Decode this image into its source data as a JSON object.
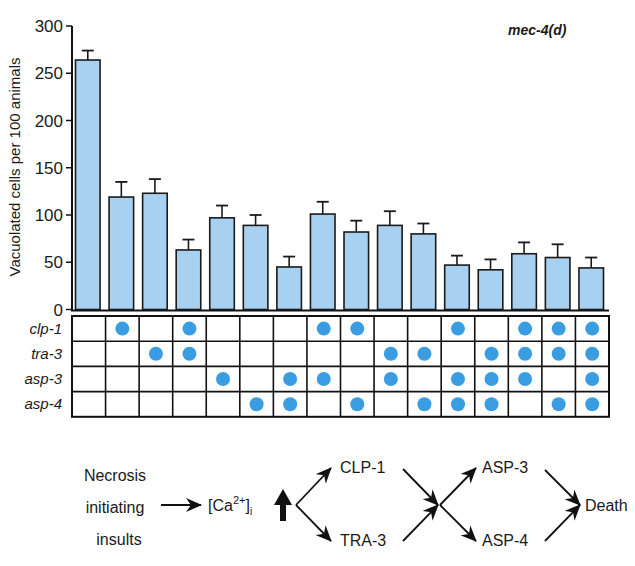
{
  "chart_data": {
    "type": "bar",
    "title": "",
    "strain_label": "mec-4(d)",
    "xlabel": "",
    "ylabel": "Vacuolated cells per 100 animals",
    "ylim": [
      0,
      300
    ],
    "yticks": [
      0,
      50,
      100,
      150,
      200,
      250,
      300
    ],
    "grid": false,
    "legend": null,
    "categories": [
      "1",
      "2",
      "3",
      "4",
      "5",
      "6",
      "7",
      "8",
      "9",
      "10",
      "11",
      "12",
      "13",
      "14",
      "15",
      "16"
    ],
    "series": [
      {
        "name": "Vacuolated cells per 100 animals",
        "values": [
          264,
          119,
          123,
          63,
          97,
          89,
          45,
          101,
          82,
          89,
          80,
          47,
          42,
          59,
          55,
          44
        ],
        "error_upper": [
          274,
          135,
          138,
          74,
          110,
          100,
          56,
          114,
          94,
          104,
          91,
          57,
          53,
          71,
          69,
          55
        ],
        "color": "#a8d0f0"
      }
    ],
    "genotype_table": {
      "rows": [
        "clp-1",
        "tra-3",
        "asp-3",
        "asp-4"
      ],
      "dot_color": "#3b9de1",
      "matrix": [
        [
          0,
          1,
          0,
          1,
          0,
          0,
          0,
          1,
          1,
          0,
          0,
          1,
          0,
          1,
          1,
          1
        ],
        [
          0,
          0,
          1,
          1,
          0,
          0,
          0,
          0,
          0,
          1,
          1,
          0,
          1,
          1,
          1,
          1
        ],
        [
          0,
          0,
          0,
          0,
          1,
          0,
          1,
          1,
          0,
          1,
          0,
          1,
          1,
          1,
          0,
          1
        ],
        [
          0,
          0,
          0,
          0,
          0,
          1,
          1,
          0,
          1,
          0,
          1,
          1,
          1,
          0,
          1,
          1
        ]
      ]
    }
  },
  "pathway": {
    "insult_lines": [
      "Necrosis",
      "initiating",
      "insults"
    ],
    "calcium": "[Ca",
    "calcium_sup": "2+",
    "calcium_close": "]",
    "calcium_sub": "i",
    "upper_first": "CLP-1",
    "lower_first": "TRA-3",
    "upper_second": "ASP-3",
    "lower_second": "ASP-4",
    "outcome": "Death"
  }
}
